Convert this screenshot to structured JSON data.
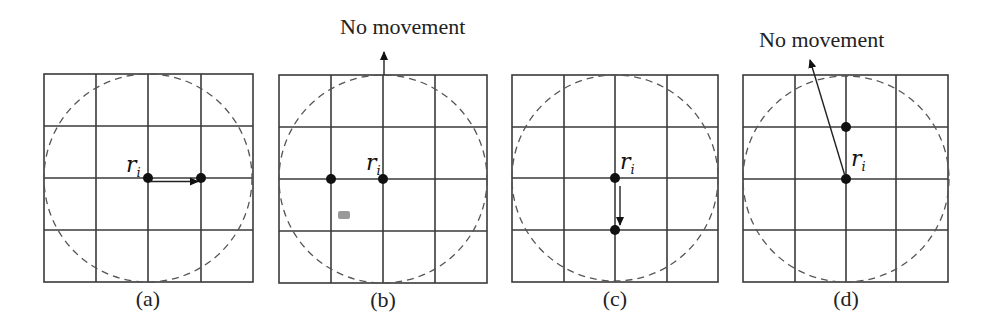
{
  "figure": {
    "panels": [
      {
        "id": "a",
        "caption": "(a)",
        "robot_label": "r",
        "robot_sub": "i",
        "annotation": ""
      },
      {
        "id": "b",
        "caption": "(b)",
        "robot_label": "r",
        "robot_sub": "i",
        "annotation": "No movement"
      },
      {
        "id": "c",
        "caption": "(c)",
        "robot_label": "r",
        "robot_sub": "i",
        "annotation": ""
      },
      {
        "id": "d",
        "caption": "(d)",
        "robot_label": "r",
        "robot_sub": "i",
        "annotation": "No movement"
      }
    ],
    "grid": {
      "rows": 4,
      "cols": 4
    },
    "colors": {
      "grid": "#3a3a3a",
      "circle": "#555555",
      "robot": "#111111",
      "smudge": "#999999"
    }
  }
}
